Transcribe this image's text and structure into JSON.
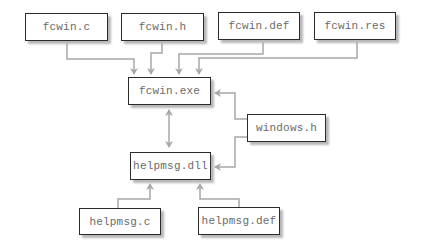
{
  "diagram": {
    "type": "build-dependency",
    "colors": {
      "box_border": "#2b2b2b",
      "box_text": "#6a6a6a",
      "connector": "#a8a8a8",
      "shadow": "#b8b8b8"
    },
    "nodes": {
      "fcwin_c": {
        "label": "fcwin.c"
      },
      "fcwin_h": {
        "label": "fcwin.h"
      },
      "fcwin_def": {
        "label": "fcwin.def"
      },
      "fcwin_res": {
        "label": "fcwin.res"
      },
      "fcwin_exe": {
        "label": "fcwin.exe"
      },
      "windows_h": {
        "label": "windows.h"
      },
      "helpmsg_dll": {
        "label": "helpmsg.dll"
      },
      "helpmsg_c": {
        "label": "helpmsg.c"
      },
      "helpmsg_def": {
        "label": "helpmsg.def"
      }
    },
    "edges": [
      {
        "from": "fcwin.c",
        "to": "fcwin.exe",
        "style": "arrow"
      },
      {
        "from": "fcwin.h",
        "to": "fcwin.exe",
        "style": "arrow"
      },
      {
        "from": "fcwin.def",
        "to": "fcwin.exe",
        "style": "arrow"
      },
      {
        "from": "fcwin.res",
        "to": "fcwin.exe",
        "style": "arrow"
      },
      {
        "from": "windows.h",
        "to": "fcwin.exe",
        "style": "arrow"
      },
      {
        "from": "windows.h",
        "to": "helpmsg.dll",
        "style": "arrow"
      },
      {
        "from": "fcwin.exe",
        "to": "helpmsg.dll",
        "style": "bidirectional"
      },
      {
        "from": "helpmsg.c",
        "to": "helpmsg.dll",
        "style": "arrow"
      },
      {
        "from": "helpmsg.def",
        "to": "helpmsg.dll",
        "style": "arrow"
      }
    ]
  }
}
